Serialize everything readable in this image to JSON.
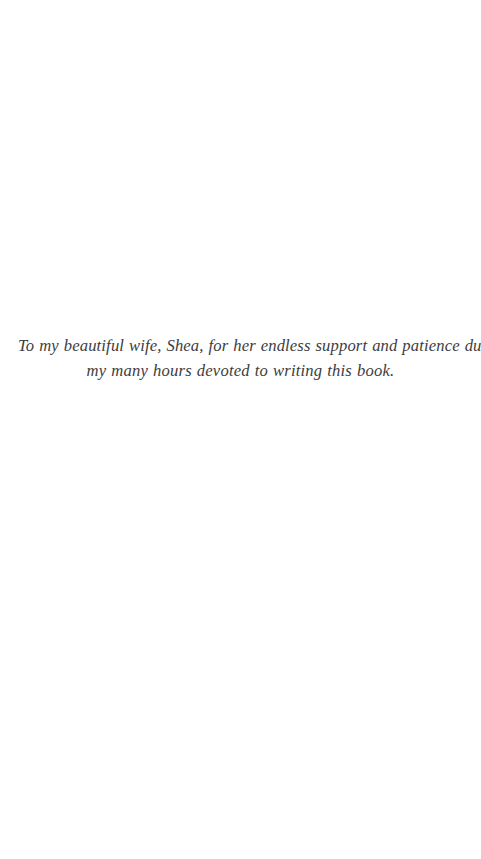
{
  "page": {
    "type": "book-dedication-page",
    "background_color": "#ffffff",
    "text_color": "#3c3c3e",
    "width": 481,
    "height": 859
  },
  "dedication": {
    "alignment": "center",
    "style": "serif-italic",
    "lines": [
      "To my beautiful wife, Shea, for her endless support and patience during",
      "my many hours devoted to writing this book."
    ],
    "full_text": "To my beautiful wife, Shea, for her endless support and patience during my many hours devoted to writing this book."
  }
}
